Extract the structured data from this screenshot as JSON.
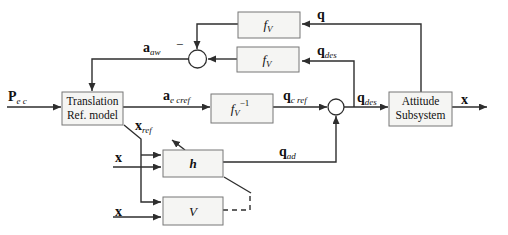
{
  "colors": {
    "bg": "#ffffff",
    "line": "#2e2e2e",
    "block_fill": "#f5f5f3",
    "block_border": "#777777",
    "text": "#111111"
  },
  "blocks": {
    "translation": {
      "line1": "Translation",
      "line2": "Ref. model"
    },
    "attitude": {
      "line1": "Attitude",
      "line2": "Subsystem"
    },
    "fv_top": {
      "base": "f",
      "sub": "V"
    },
    "fv_mid": {
      "base": "f",
      "sub": "V"
    },
    "fv_inv": {
      "base": "f",
      "sub": "V",
      "sup": "−1"
    },
    "h": {
      "label": "h"
    },
    "v": {
      "label": "V"
    }
  },
  "signals": {
    "p_ec": {
      "base": "P",
      "sub": "e c"
    },
    "a_aw": {
      "base": "a",
      "sub": "aw"
    },
    "a_ecref": {
      "base": "a",
      "sub": "e cref"
    },
    "q_cref": {
      "base": "q",
      "sub": "c ref"
    },
    "q_des_mid": {
      "base": "q",
      "sub": "des"
    },
    "q_des_fb": {
      "base": "q",
      "sub": "des"
    },
    "q_fb": {
      "base": "q"
    },
    "q_ad": {
      "base": "q",
      "sub": "ad"
    },
    "x_ref": {
      "base": "x",
      "sub": "ref"
    },
    "x_in_h": {
      "base": "x"
    },
    "x_in_v": {
      "base": "x"
    },
    "x_out": {
      "base": "x"
    },
    "minus_sign": "−"
  }
}
